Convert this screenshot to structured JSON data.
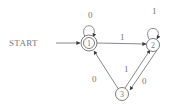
{
  "diagram": {
    "type": "finite-automaton",
    "start_label": "START",
    "colors": {
      "line": "#6a6a6a",
      "text": "#777777",
      "background": "#ffffff"
    },
    "states": [
      {
        "id": "1",
        "label": "1",
        "accepting": true,
        "start": true
      },
      {
        "id": "2",
        "label": "2",
        "accepting": false,
        "start": false
      },
      {
        "id": "3",
        "label": "3",
        "accepting": false,
        "start": false
      }
    ],
    "transitions": [
      {
        "from": "1",
        "to": "1",
        "label": "0"
      },
      {
        "from": "1",
        "to": "2",
        "label": "1"
      },
      {
        "from": "2",
        "to": "2",
        "label": "1"
      },
      {
        "from": "2",
        "to": "3",
        "label": "0"
      },
      {
        "from": "3",
        "to": "2",
        "label": "1"
      },
      {
        "from": "3",
        "to": "1",
        "label": "0"
      }
    ]
  }
}
